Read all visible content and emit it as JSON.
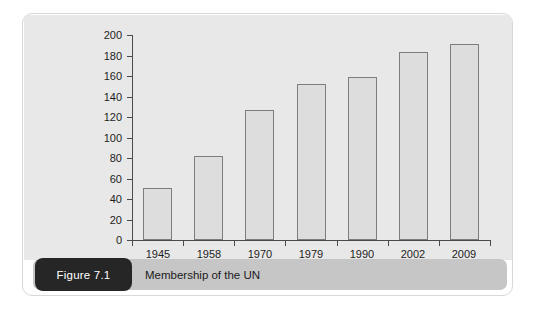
{
  "figure": {
    "badge_label": "Figure 7.1",
    "caption": "Membership of the UN"
  },
  "colors": {
    "card_background": "#ffffff",
    "plot_background": "#e8e8e8",
    "bar_fill": "#dddddd",
    "bar_outline": "#7d7d7d",
    "axis": "#4a4a4a",
    "caption_band": "#c6c6c6",
    "badge_background": "#262626",
    "badge_text": "#ffffff",
    "tick_text": "#1d1d1d"
  },
  "chart_data": {
    "type": "bar",
    "title": "Membership of the UN",
    "xlabel": "",
    "ylabel": "",
    "categories": [
      "1945",
      "1958",
      "1970",
      "1979",
      "1990",
      "2002",
      "2009"
    ],
    "values": [
      51,
      82,
      127,
      152,
      159,
      183,
      191
    ],
    "ylim": [
      0,
      200
    ],
    "yticks": [
      0,
      20,
      40,
      60,
      80,
      100,
      120,
      140,
      160,
      180,
      200
    ],
    "ytick_labels": [
      "0",
      "20",
      "40",
      "60",
      "80",
      "100",
      "120",
      "140",
      "160",
      "180",
      "200"
    ],
    "grid": false,
    "legend": null
  }
}
